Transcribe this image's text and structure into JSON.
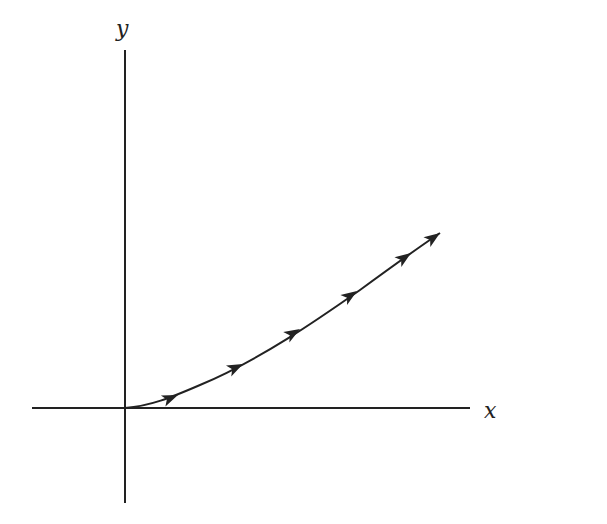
{
  "diagram": {
    "type": "phase-trajectory",
    "axes": {
      "x_label": "x",
      "y_label": "y",
      "x_axis": {
        "x1": 32,
        "x2": 470,
        "y": 408
      },
      "y_axis": {
        "x": 125,
        "y1": 50,
        "y2": 503
      },
      "stroke": "#222222"
    },
    "curve": {
      "path": "M125,408 C150,406 170,398 200,385 C260,360 320,318 360,290 C390,268 415,250 440,233",
      "stroke": "#222222",
      "arrows": [
        {
          "x": 178,
          "y": 395,
          "angle": -22
        },
        {
          "x": 243,
          "y": 364,
          "angle": -26
        },
        {
          "x": 300,
          "y": 329,
          "angle": -31
        },
        {
          "x": 357,
          "y": 291,
          "angle": -34
        },
        {
          "x": 411,
          "y": 253,
          "angle": -35
        },
        {
          "x": 440,
          "y": 233,
          "angle": -35
        }
      ]
    }
  }
}
